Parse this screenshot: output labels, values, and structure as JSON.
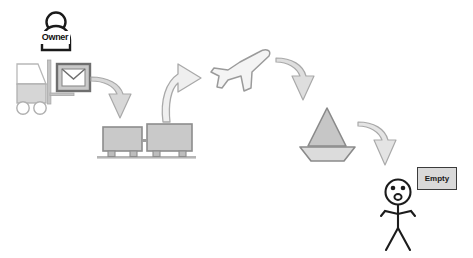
{
  "diagram": {
    "background_color": "#ffffff",
    "nodes": {
      "owner": {
        "name": "Owner",
        "label": "Owner",
        "icon": "person-icon",
        "label_bg": "#ffffff",
        "label_color": "#111111"
      },
      "forklift": {
        "name": "Forklift with package",
        "icon": "forklift-icon",
        "body_color": "#d6d6d6",
        "outline_color": "#9a9a9a"
      },
      "envelope": {
        "name": "Envelope package",
        "icon": "envelope-icon",
        "fill_color": "#d0d0d0",
        "frame_color": "#808080"
      },
      "railcars": {
        "name": "Rail cars on track",
        "icon": "train-cars-icon",
        "count": 2,
        "fill_color": "#c9c9c9",
        "outline_color": "#8d8d8d"
      },
      "airplane": {
        "name": "Airplane",
        "icon": "airplane-icon",
        "fill_color": "#f2f2f2",
        "outline_color": "#9b9b9b"
      },
      "ship": {
        "name": "Sailboat",
        "icon": "sailboat-icon",
        "sail_color": "#c4c4c4",
        "hull_color": "#d8d8d8",
        "outline_color": "#8a8a8a"
      },
      "recipient": {
        "name": "Surprised recipient",
        "icon": "stick-figure-icon",
        "expression": "surprised",
        "stroke_color": "#1c1c1c"
      },
      "empty": {
        "name": "Empty status box",
        "label": "Empty",
        "bg_color": "#d9d9d9",
        "border_color": "#3b3b3b",
        "text_color": "#1a1a1a"
      }
    },
    "arrows": [
      {
        "name": "arrow-forklift-to-railcars",
        "direction": "down",
        "color": "#cfcfcf",
        "outline": "#a6a6a6"
      },
      {
        "name": "arrow-railcars-to-airplane",
        "direction": "up-right",
        "color": "#eaeaea",
        "outline": "#a6a6a6"
      },
      {
        "name": "arrow-airplane-to-ship",
        "direction": "down",
        "color": "#dcdcdc",
        "outline": "#a6a6a6"
      },
      {
        "name": "arrow-ship-to-recipient",
        "direction": "down",
        "color": "#e2e2e2",
        "outline": "#a6a6a6"
      }
    ]
  }
}
